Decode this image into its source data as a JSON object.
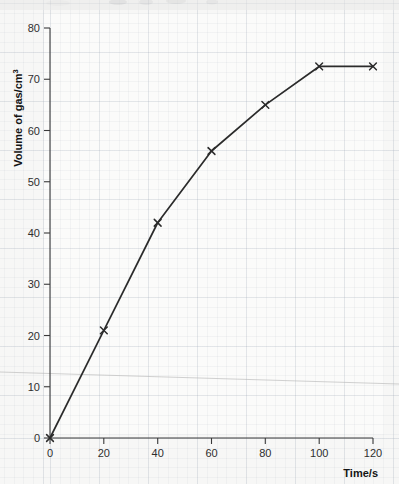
{
  "chart_data": {
    "type": "line",
    "title": "",
    "subtitle": "",
    "xlabel": "Time/s",
    "ylabel": "Volume of gas/cm³",
    "ylabel_base": "Volume of gas/cm",
    "ylabel_exponent": "3",
    "x": [
      0,
      20,
      40,
      60,
      80,
      100,
      120
    ],
    "values": [
      0,
      21,
      42,
      56,
      65,
      72.5,
      72.5
    ],
    "series": [
      {
        "name": "Volume of gas",
        "x": [
          0,
          20,
          40,
          60,
          80,
          100,
          120
        ],
        "values": [
          0,
          21,
          42,
          56,
          65,
          72.5,
          72.5
        ]
      }
    ],
    "xlim": [
      0,
      120
    ],
    "ylim": [
      0,
      80
    ],
    "xticks": [
      0,
      20,
      40,
      60,
      80,
      100,
      120
    ],
    "yticks": [
      0,
      10,
      20,
      30,
      40,
      50,
      60,
      70,
      80
    ],
    "xtick_labels": [
      "0",
      "20",
      "40",
      "60",
      "80",
      "100",
      "120"
    ],
    "ytick_labels": [
      "0",
      "10",
      "20",
      "30",
      "40",
      "50",
      "60",
      "70",
      "80"
    ],
    "grid": true,
    "grid_style": "graph-paper",
    "legend": false,
    "legend_position": "none",
    "marker": "x",
    "line_color": "#2b2b2b",
    "marker_color": "#2b2b2b",
    "background_color": "#f7f7f6",
    "grid_color": "#8c98aa",
    "annotations": []
  },
  "figure": {
    "background_color": "#f6f6f5",
    "paper_color": "#ffffff",
    "artifact_note": "scan-line"
  }
}
